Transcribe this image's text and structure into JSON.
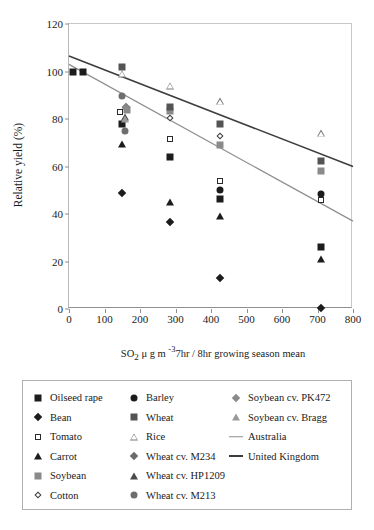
{
  "chart_data": {
    "type": "scatter",
    "title": "",
    "xlabel_parts": {
      "base": "SO",
      "sub": "2",
      "mid": " μ g m ",
      "sup": "-3",
      "tail": "7hr / 8hr growing season mean"
    },
    "xlabel": "SO2 μ g m -3 7hr / 8hr growing season mean",
    "ylabel": "Relative yield (%)",
    "xlim": [
      0,
      800
    ],
    "ylim": [
      0,
      120
    ],
    "xticks": [
      0,
      100,
      200,
      300,
      400,
      500,
      600,
      700,
      800
    ],
    "yticks": [
      0,
      20,
      40,
      60,
      80,
      100,
      120
    ],
    "grid": false,
    "legend_position": "below-plot",
    "series": [
      {
        "name": "Oilseed rape",
        "marker": "filled-square",
        "color": "#1c1c1c",
        "points": [
          [
            10,
            100
          ],
          [
            40,
            100
          ],
          [
            150,
            78
          ],
          [
            285,
            64
          ],
          [
            425,
            46.5
          ],
          [
            710,
            26
          ]
        ]
      },
      {
        "name": "Bean",
        "marker": "filled-diamond",
        "color": "#1c1c1c",
        "points": [
          [
            150,
            49
          ],
          [
            285,
            36.5
          ],
          [
            425,
            13
          ],
          [
            710,
            0.3
          ]
        ]
      },
      {
        "name": "Tomato",
        "marker": "open-square",
        "color": "#2b2b2b",
        "points": [
          [
            145,
            83
          ],
          [
            285,
            71.5
          ],
          [
            425,
            54
          ],
          [
            710,
            46
          ]
        ]
      },
      {
        "name": "Carrot",
        "marker": "filled-triangle",
        "color": "#1c1c1c",
        "points": [
          [
            150,
            69.5
          ],
          [
            285,
            45
          ],
          [
            425,
            39
          ],
          [
            710,
            21
          ]
        ]
      },
      {
        "name": "Soybean",
        "marker": "gray-square",
        "color": "#8a8a8a",
        "points": [
          [
            163,
            84
          ],
          [
            285,
            83.5
          ],
          [
            425,
            69
          ],
          [
            710,
            58
          ]
        ]
      },
      {
        "name": "Cotton",
        "marker": "open-diamond",
        "color": "#3a3a3a",
        "points": [
          [
            285,
            80.5
          ],
          [
            425,
            73
          ]
        ]
      },
      {
        "name": "Barley",
        "marker": "filled-circle",
        "color": "#1c1c1c",
        "points": [
          [
            425,
            50
          ],
          [
            710,
            48.5
          ]
        ]
      },
      {
        "name": "Wheat",
        "marker": "dark-gray-square",
        "color": "#545454",
        "points": [
          [
            148,
            102
          ],
          [
            285,
            85
          ],
          [
            425,
            78
          ],
          [
            710,
            62.5
          ]
        ]
      },
      {
        "name": "Rice",
        "marker": "open-triangle",
        "color": "#777777",
        "points": [
          [
            150,
            99
          ],
          [
            285,
            94
          ],
          [
            425,
            87.5
          ],
          [
            710,
            74
          ]
        ]
      },
      {
        "name": "Wheat cv. M234",
        "marker": "gray-diamond",
        "color": "#6b6b6b",
        "points": [
          [
            160,
            85
          ]
        ]
      },
      {
        "name": "Wheat cv. HP1209",
        "marker": "dark-triangle",
        "color": "#4a4a4a",
        "points": [
          [
            158,
            81
          ]
        ]
      },
      {
        "name": "Wheat cv. M213",
        "marker": "gray-circle",
        "color": "#6e6e6e",
        "points": [
          [
            148,
            89.5
          ],
          [
            157,
            75
          ]
        ]
      },
      {
        "name": "Soybean cv. PK472",
        "marker": "gray-diamond",
        "color": "#8a8a8a",
        "points": [
          [
            160,
            84.5
          ]
        ]
      },
      {
        "name": "Soybean cv. Bragg",
        "marker": "gray-triangle",
        "color": "#9a9a9a",
        "points": [
          [
            158,
            80
          ]
        ]
      }
    ],
    "trendlines": [
      {
        "name": "Australia",
        "color": "#8e8e8e",
        "x_from": 0,
        "y_from": 103,
        "x_to": 800,
        "y_to": 37
      },
      {
        "name": "United Kingdom",
        "color": "#3d3d3d",
        "x_from": 0,
        "y_from": 106.5,
        "x_to": 800,
        "y_to": 60
      }
    ]
  },
  "legend": {
    "columns": [
      {
        "items": [
          {
            "label": "Oilseed rape",
            "marker": "filled-square"
          },
          {
            "label": "Bean",
            "marker": "filled-diamond"
          },
          {
            "label": "Tomato",
            "marker": "open-square"
          },
          {
            "label": "Carrot",
            "marker": "filled-triangle"
          },
          {
            "label": "Soybean",
            "marker": "gray-square"
          },
          {
            "label": "Cotton",
            "marker": "open-diamond"
          }
        ]
      },
      {
        "items": [
          {
            "label": "Barley",
            "marker": "filled-circle"
          },
          {
            "label": "Wheat",
            "marker": "dark-gray-square"
          },
          {
            "label": "Rice",
            "marker": "open-triangle"
          },
          {
            "label": "Wheat cv. M234",
            "marker": "gray-diamond"
          },
          {
            "label": "Wheat cv. HP1209",
            "marker": "dark-triangle"
          },
          {
            "label": "Wheat cv. M213",
            "marker": "gray-circle"
          }
        ]
      },
      {
        "items": [
          {
            "label": "Soybean cv. PK472",
            "marker": "gray-diamond-sm"
          },
          {
            "label": "Soybean cv. Bragg",
            "marker": "gray-triangle-sm"
          },
          {
            "label": "Australia",
            "marker": "line-gray"
          },
          {
            "label": "United Kingdom",
            "marker": "line-dark"
          }
        ]
      }
    ]
  }
}
